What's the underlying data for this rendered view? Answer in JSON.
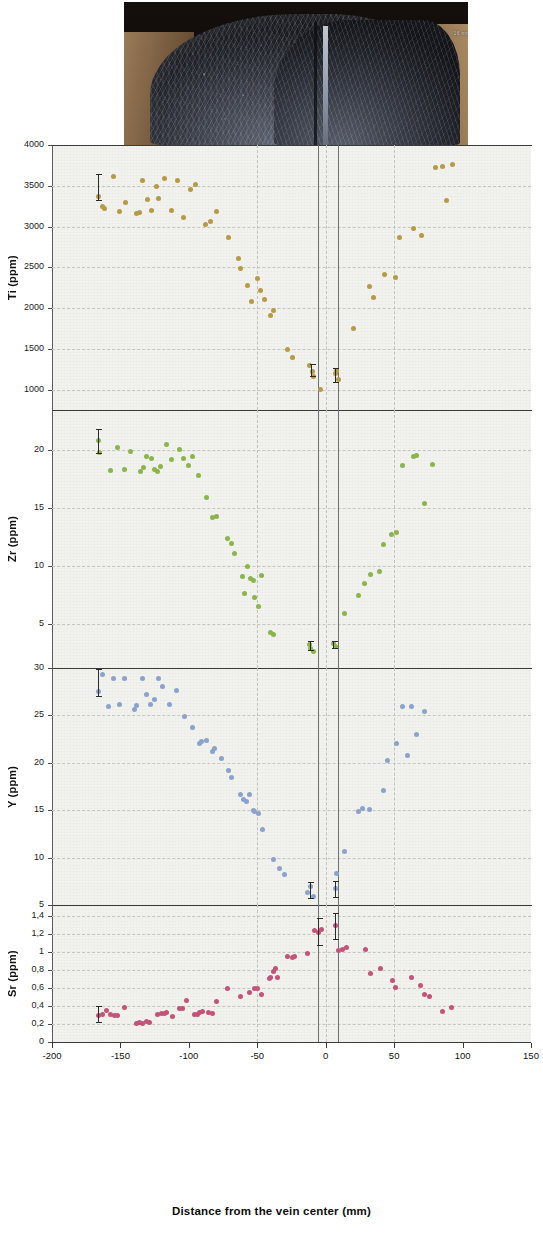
{
  "figure": {
    "photo": {
      "name": "vein-hand-specimen-photo",
      "scale_label": "16 mm"
    },
    "x_axis": {
      "label": "Distance from the vein center (mm)",
      "min": -200,
      "max": 150,
      "ticks": [
        -200,
        -150,
        -100,
        -50,
        0,
        50,
        100,
        150
      ],
      "tick_labels": [
        "-200",
        "-150",
        "-100",
        "-50",
        "0",
        "50",
        "100",
        "150"
      ],
      "gridlines": [
        -50,
        0,
        50
      ],
      "vein_boundaries": [
        -6,
        9
      ]
    },
    "panels": [
      {
        "id": "ti",
        "ylabel": "Ti (ppm)",
        "ymin": 750,
        "ymax": 4000,
        "ticks": [
          1000,
          1500,
          2000,
          2500,
          3000,
          3500,
          4000
        ],
        "tick_labels": [
          "1000",
          "1500",
          "2000",
          "2500",
          "3000",
          "3500",
          "4000"
        ],
        "color": "#b79a46"
      },
      {
        "id": "zr",
        "ylabel": "Zr (ppm)",
        "ymin": 1.2,
        "ymax": 23.5,
        "ticks": [
          5,
          10,
          15,
          20
        ],
        "tick_labels": [
          "5",
          "10",
          "15",
          "20"
        ],
        "color": "#8cb44a"
      },
      {
        "id": "y",
        "ylabel": "Y (ppm)",
        "ymin": 5,
        "ymax": 30,
        "ticks": [
          5,
          10,
          15,
          20,
          25,
          30
        ],
        "tick_labels": [
          "5",
          "10",
          "15",
          "20",
          "25",
          "30"
        ],
        "color": "#8aa2cc"
      },
      {
        "id": "sr",
        "ylabel": "Sr (ppm)",
        "ymin": 0,
        "ymax": 1.52,
        "ticks": [
          0,
          0.2,
          0.4,
          0.6,
          0.8,
          1.0,
          1.2,
          1.4
        ],
        "tick_labels": [
          "0",
          "0,2",
          "0,4",
          "0,6",
          "0,8",
          "1",
          "1,2",
          "1,4"
        ],
        "color": "#c4537a"
      }
    ]
  },
  "chart_data": [
    {
      "type": "scatter",
      "id": "ti",
      "title": "",
      "xlabel": "Distance from the vein center (mm)",
      "ylabel": "Ti (ppm)",
      "xlim": [
        -200,
        150
      ],
      "ylim": [
        750,
        4000
      ],
      "grid": true,
      "color": "#b79a46",
      "points": [
        [
          -166,
          3370
        ],
        [
          -163,
          3250
        ],
        [
          -162,
          3220
        ],
        [
          -155,
          3610
        ],
        [
          -151,
          3190
        ],
        [
          -146,
          3290
        ],
        [
          -138,
          3160
        ],
        [
          -136,
          3175
        ],
        [
          -134,
          3570
        ],
        [
          -130,
          3330
        ],
        [
          -127,
          3200
        ],
        [
          -124,
          3490
        ],
        [
          -122,
          3350
        ],
        [
          -118,
          3590
        ],
        [
          -113,
          3200
        ],
        [
          -108,
          3570
        ],
        [
          -104,
          3110
        ],
        [
          -99,
          3450
        ],
        [
          -95,
          3520
        ],
        [
          -88,
          3030
        ],
        [
          -84,
          3060
        ],
        [
          -80,
          3180
        ],
        [
          -71,
          2870
        ],
        [
          -64,
          2610
        ],
        [
          -62,
          2490
        ],
        [
          -57,
          2280
        ],
        [
          -54,
          2080
        ],
        [
          -50,
          2360
        ],
        [
          -48,
          2210
        ],
        [
          -45,
          2100
        ],
        [
          -40,
          1910
        ],
        [
          -38,
          1970
        ],
        [
          -28,
          1490
        ],
        [
          -24,
          1400
        ],
        [
          -12,
          1290
        ],
        [
          -10,
          1220
        ],
        [
          -9,
          1160
        ],
        [
          -4,
          1000
        ],
        [
          7,
          1200
        ],
        [
          8,
          1230
        ],
        [
          9,
          1120
        ],
        [
          20,
          1750
        ],
        [
          32,
          2270
        ],
        [
          35,
          2130
        ],
        [
          43,
          2410
        ],
        [
          51,
          2370
        ],
        [
          54,
          2870
        ],
        [
          64,
          2980
        ],
        [
          70,
          2890
        ],
        [
          80,
          3720
        ],
        [
          85,
          3740
        ],
        [
          88,
          3320
        ],
        [
          93,
          3760
        ]
      ]
    },
    {
      "type": "scatter",
      "id": "zr",
      "title": "",
      "xlabel": "Distance from the vein center (mm)",
      "ylabel": "Zr (ppm)",
      "xlim": [
        -200,
        150
      ],
      "ylim": [
        1.2,
        23.5
      ],
      "grid": true,
      "color": "#8cb44a",
      "points": [
        [
          -166,
          20.9
        ],
        [
          -165,
          19.8
        ],
        [
          -157,
          18.3
        ],
        [
          -152,
          20.3
        ],
        [
          -147,
          18.4
        ],
        [
          -143,
          19.9
        ],
        [
          -135,
          18.2
        ],
        [
          -133,
          18.5
        ],
        [
          -131,
          19.5
        ],
        [
          -127,
          19.3
        ],
        [
          -125,
          18.4
        ],
        [
          -123,
          18.2
        ],
        [
          -121,
          18.6
        ],
        [
          -116,
          20.5
        ],
        [
          -113,
          19.2
        ],
        [
          -107,
          20.1
        ],
        [
          -104,
          19.3
        ],
        [
          -100,
          18.7
        ],
        [
          -97,
          19.5
        ],
        [
          -93,
          17.8
        ],
        [
          -87,
          15.9
        ],
        [
          -83,
          14.2
        ],
        [
          -80,
          14.3
        ],
        [
          -72,
          12.4
        ],
        [
          -69,
          12.0
        ],
        [
          -67,
          11.1
        ],
        [
          -61,
          9.1
        ],
        [
          -59,
          7.6
        ],
        [
          -57,
          10.0
        ],
        [
          -55,
          8.9
        ],
        [
          -53,
          8.8
        ],
        [
          -52,
          7.3
        ],
        [
          -49,
          6.5
        ],
        [
          -47,
          9.2
        ],
        [
          -40,
          4.3
        ],
        [
          -38,
          4.1
        ],
        [
          -12,
          3.2
        ],
        [
          -11,
          2.9
        ],
        [
          -9,
          2.6
        ],
        [
          6,
          3.3
        ],
        [
          7,
          3.1
        ],
        [
          14,
          5.9
        ],
        [
          24,
          7.5
        ],
        [
          28,
          8.5
        ],
        [
          33,
          9.3
        ],
        [
          39,
          9.5
        ],
        [
          42,
          11.9
        ],
        [
          48,
          12.7
        ],
        [
          52,
          12.9
        ],
        [
          56,
          18.7
        ],
        [
          64,
          19.5
        ],
        [
          66,
          19.6
        ],
        [
          72,
          15.4
        ],
        [
          78,
          18.8
        ]
      ]
    },
    {
      "type": "scatter",
      "id": "y",
      "title": "",
      "xlabel": "Distance from the vein center (mm)",
      "ylabel": "Y (ppm)",
      "xlim": [
        -200,
        150
      ],
      "ylim": [
        5,
        30
      ],
      "grid": true,
      "color": "#8aa2cc",
      "points": [
        [
          -166,
          27.5
        ],
        [
          -163,
          29.3
        ],
        [
          -159,
          25.9
        ],
        [
          -155,
          28.9
        ],
        [
          -151,
          26.1
        ],
        [
          -147,
          28.9
        ],
        [
          -140,
          25.6
        ],
        [
          -138,
          26.0
        ],
        [
          -134,
          28.9
        ],
        [
          -131,
          27.2
        ],
        [
          -128,
          26.1
        ],
        [
          -125,
          26.7
        ],
        [
          -122,
          28.9
        ],
        [
          -119,
          28.0
        ],
        [
          -114,
          26.2
        ],
        [
          -109,
          27.6
        ],
        [
          -103,
          24.9
        ],
        [
          -97,
          23.7
        ],
        [
          -92,
          22.0
        ],
        [
          -91,
          22.2
        ],
        [
          -87,
          22.4
        ],
        [
          -83,
          21.2
        ],
        [
          -81,
          21.5
        ],
        [
          -76,
          20.5
        ],
        [
          -71,
          19.2
        ],
        [
          -69,
          18.4
        ],
        [
          -62,
          16.7
        ],
        [
          -60,
          16.1
        ],
        [
          -58,
          15.9
        ],
        [
          -56,
          16.7
        ],
        [
          -53,
          15.0
        ],
        [
          -52,
          14.9
        ],
        [
          -49,
          14.6
        ],
        [
          -46,
          13.0
        ],
        [
          -38,
          9.8
        ],
        [
          -34,
          8.8
        ],
        [
          -30,
          8.2
        ],
        [
          -13,
          6.3
        ],
        [
          -11,
          7.0
        ],
        [
          -9,
          5.9
        ],
        [
          7,
          6.7
        ],
        [
          8,
          8.3
        ],
        [
          14,
          10.6
        ],
        [
          24,
          14.9
        ],
        [
          27,
          15.2
        ],
        [
          32,
          15.1
        ],
        [
          42,
          17.1
        ],
        [
          45,
          20.2
        ],
        [
          52,
          22.0
        ],
        [
          56,
          25.9
        ],
        [
          60,
          20.8
        ],
        [
          63,
          25.9
        ],
        [
          66,
          23.0
        ],
        [
          72,
          25.4
        ]
      ]
    },
    {
      "type": "scatter",
      "id": "sr",
      "title": "",
      "xlabel": "Distance from the vein center (mm)",
      "ylabel": "Sr (ppm)",
      "xlim": [
        -200,
        150
      ],
      "ylim": [
        0,
        1.52
      ],
      "grid": true,
      "color": "#c4537a",
      "points": [
        [
          -166,
          0.29
        ],
        [
          -163,
          0.3
        ],
        [
          -160,
          0.35
        ],
        [
          -157,
          0.31
        ],
        [
          -154,
          0.29
        ],
        [
          -152,
          0.29
        ],
        [
          -147,
          0.38
        ],
        [
          -138,
          0.21
        ],
        [
          -136,
          0.215
        ],
        [
          -134,
          0.21
        ],
        [
          -131,
          0.23
        ],
        [
          -129,
          0.22
        ],
        [
          -123,
          0.31
        ],
        [
          -120,
          0.32
        ],
        [
          -118,
          0.32
        ],
        [
          -116,
          0.33
        ],
        [
          -112,
          0.28
        ],
        [
          -107,
          0.37
        ],
        [
          -105,
          0.375
        ],
        [
          -102,
          0.46
        ],
        [
          -96,
          0.31
        ],
        [
          -94,
          0.3
        ],
        [
          -92,
          0.33
        ],
        [
          -90,
          0.335
        ],
        [
          -86,
          0.33
        ],
        [
          -83,
          0.32
        ],
        [
          -80,
          0.45
        ],
        [
          -72,
          0.595
        ],
        [
          -62,
          0.5
        ],
        [
          -56,
          0.55
        ],
        [
          -52,
          0.59
        ],
        [
          -50,
          0.595
        ],
        [
          -47,
          0.53
        ],
        [
          -41,
          0.71
        ],
        [
          -40,
          0.715
        ],
        [
          -38,
          0.78
        ],
        [
          -37,
          0.82
        ],
        [
          -35,
          0.72
        ],
        [
          -28,
          0.95
        ],
        [
          -24,
          0.94
        ],
        [
          -23,
          0.945
        ],
        [
          -13,
          0.98
        ],
        [
          -8,
          1.235
        ],
        [
          -5,
          1.22
        ],
        [
          -3,
          1.245
        ],
        [
          7,
          1.29
        ],
        [
          9,
          1.02
        ],
        [
          12,
          1.03
        ],
        [
          15,
          1.05
        ],
        [
          29,
          1.03
        ],
        [
          33,
          0.755
        ],
        [
          40,
          0.82
        ],
        [
          49,
          0.685
        ],
        [
          51,
          0.605
        ],
        [
          63,
          0.72
        ],
        [
          69,
          0.63
        ],
        [
          72,
          0.53
        ],
        [
          76,
          0.5
        ],
        [
          85,
          0.335
        ],
        [
          92,
          0.385
        ]
      ]
    }
  ],
  "error_bars": [
    {
      "panel": "ti",
      "x": -166,
      "low": 3310,
      "high": 3640
    },
    {
      "panel": "ti",
      "x": -10,
      "low": 1160,
      "high": 1320
    },
    {
      "panel": "ti",
      "x": 7,
      "low": 1085,
      "high": 1260
    },
    {
      "panel": "zr",
      "x": -166,
      "low": 19.7,
      "high": 21.9
    },
    {
      "panel": "zr",
      "x": -11,
      "low": 2.7,
      "high": 3.5
    },
    {
      "panel": "zr",
      "x": 6,
      "low": 2.8,
      "high": 3.5
    },
    {
      "panel": "y",
      "x": -166,
      "low": 26.9,
      "high": 29.9
    },
    {
      "panel": "y",
      "x": -11,
      "low": 5.6,
      "high": 7.4
    },
    {
      "panel": "y",
      "x": 7,
      "low": 5.7,
      "high": 7.5
    },
    {
      "panel": "sr",
      "x": -166,
      "low": 0.21,
      "high": 0.4
    },
    {
      "panel": "sr",
      "x": -5,
      "low": 1.06,
      "high": 1.38
    },
    {
      "panel": "sr",
      "x": 7,
      "low": 1.13,
      "high": 1.43
    }
  ]
}
